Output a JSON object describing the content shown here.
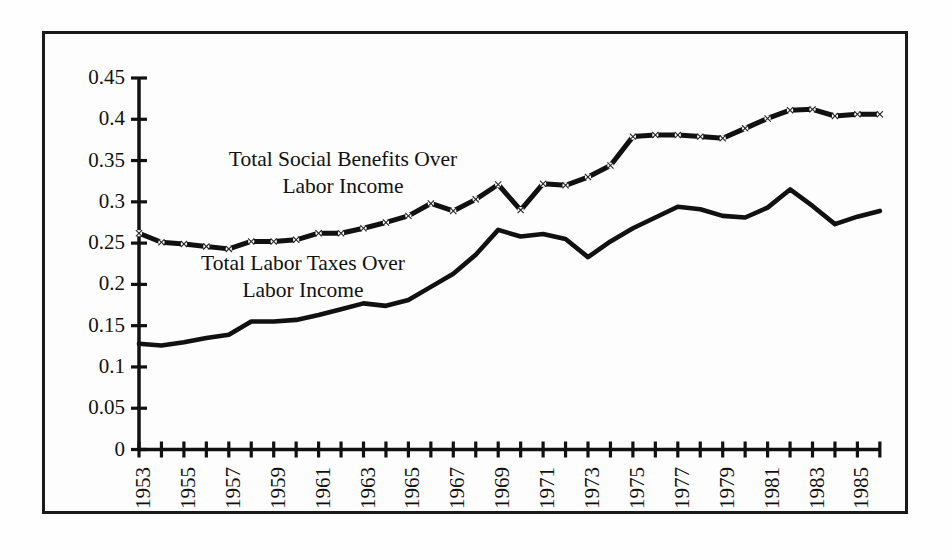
{
  "figure": {
    "background_color": "#ffffff",
    "frame_color": "#1a1a1a",
    "axis_color": "#111111"
  },
  "annotations": {
    "benefits_label_line1": "Total Social Benefits Over",
    "benefits_label_line2": "Labor Income",
    "taxes_label_line1": "Total Labor Taxes Over",
    "taxes_label_line2": "Labor Income"
  },
  "chart_data": {
    "type": "line",
    "title": "",
    "xlabel": "",
    "ylabel": "",
    "xlim": [
      1953,
      1986
    ],
    "ylim": [
      0,
      0.45
    ],
    "grid": false,
    "legend_position": "inline-annotations",
    "y_ticks": [
      "0",
      "0.05",
      "0.1",
      "0.15",
      "0.2",
      "0.25",
      "0.3",
      "0.35",
      "0.4",
      "0.45"
    ],
    "y_tick_values": [
      0,
      0.05,
      0.1,
      0.15,
      0.2,
      0.25,
      0.3,
      0.35,
      0.4,
      0.45
    ],
    "x_ticks": [
      1953,
      1954,
      1955,
      1956,
      1957,
      1958,
      1959,
      1960,
      1961,
      1962,
      1963,
      1964,
      1965,
      1966,
      1967,
      1968,
      1969,
      1970,
      1971,
      1972,
      1973,
      1974,
      1975,
      1976,
      1977,
      1978,
      1979,
      1980,
      1981,
      1982,
      1983,
      1984,
      1985,
      1986
    ],
    "x_tick_labels_shown": [
      "1953",
      "1955",
      "1957",
      "1959",
      "1961",
      "1963",
      "1965",
      "1967",
      "1969",
      "1971",
      "1973",
      "1975",
      "1977",
      "1979",
      "1981",
      "1983",
      "1985"
    ],
    "x": [
      1953,
      1954,
      1955,
      1956,
      1957,
      1958,
      1959,
      1960,
      1961,
      1962,
      1963,
      1964,
      1965,
      1966,
      1967,
      1968,
      1969,
      1970,
      1971,
      1972,
      1973,
      1974,
      1975,
      1976,
      1977,
      1978,
      1979,
      1980,
      1981,
      1982,
      1983,
      1984,
      1985,
      1986
    ],
    "series": [
      {
        "name": "Total Social Benefits Over Labor Income",
        "style": "dashed-with-markers",
        "marker": "cross",
        "color": "#111111",
        "values": [
          0.262,
          0.251,
          0.249,
          0.246,
          0.243,
          0.252,
          0.252,
          0.254,
          0.262,
          0.262,
          0.268,
          0.275,
          0.283,
          0.298,
          0.289,
          0.303,
          0.321,
          0.29,
          0.322,
          0.32,
          0.33,
          0.344,
          0.379,
          0.381,
          0.381,
          0.379,
          0.377,
          0.389,
          0.401,
          0.411,
          0.412,
          0.404,
          0.406,
          0.406
        ]
      },
      {
        "name": "Total Labor Taxes Over Labor Income",
        "style": "solid",
        "marker": "none",
        "color": "#111111",
        "values": [
          0.128,
          0.126,
          0.13,
          0.135,
          0.139,
          0.155,
          0.155,
          0.157,
          0.163,
          0.17,
          0.177,
          0.174,
          0.181,
          0.197,
          0.213,
          0.236,
          0.266,
          0.258,
          0.261,
          0.255,
          0.233,
          0.252,
          0.268,
          0.281,
          0.294,
          0.291,
          0.283,
          0.281,
          0.293,
          0.315,
          0.295,
          0.273,
          0.282,
          0.289
        ]
      }
    ]
  }
}
